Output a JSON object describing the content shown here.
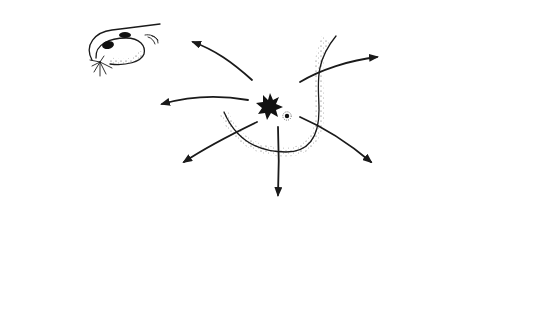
{
  "figure": {
    "subject": "Sites of distant metastasis from primary breast cancer",
    "primary": {
      "label": "primary-breast-tumor",
      "site": "breast"
    },
    "metastatic_sites": [
      {
        "id": "ovary",
        "label": "Ovary",
        "position": "top-left",
        "lesion_count": 2
      },
      {
        "id": "liver",
        "label": "Liver",
        "position": "left",
        "lesion_count": 3
      },
      {
        "id": "brain",
        "label": "Brain",
        "position": "lower-left",
        "lesion_count": 2
      },
      {
        "id": "pelvis",
        "label": "Pelvic bone",
        "position": "bottom-center",
        "lesion_count": 3
      },
      {
        "id": "lungs",
        "label": "Lungs",
        "position": "lower-right",
        "lesion_count": 7
      },
      {
        "id": "contralateral-breast",
        "label": "Contralateral breast / axillary nodes",
        "position": "top-right",
        "lesion_count": 5
      }
    ],
    "arrow_count": 6,
    "colors": {
      "ink": "#1a1a1a",
      "lesion": "#111111",
      "background": "#ffffff"
    }
  }
}
